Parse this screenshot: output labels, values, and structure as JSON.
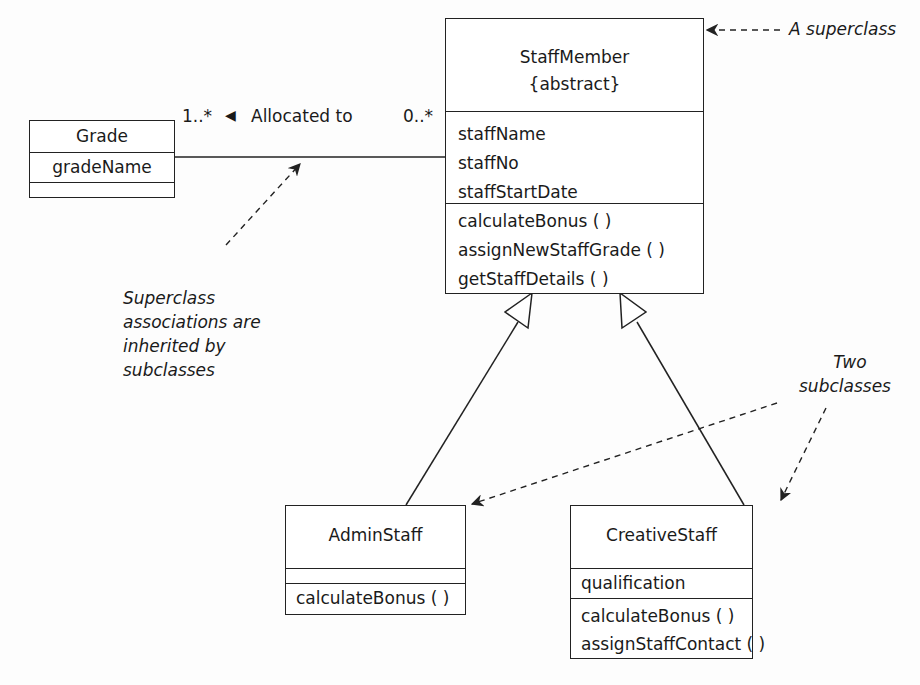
{
  "diagram": {
    "type": "UML class diagram",
    "classes": {
      "grade": {
        "name": "Grade",
        "attributes": [
          "gradeName"
        ],
        "operations": []
      },
      "staff_member": {
        "name": "StaffMember",
        "stereotype": "{abstract}",
        "attributes": [
          "staffName",
          "staffNo",
          "staffStartDate"
        ],
        "operations": [
          "calculateBonus ( )",
          "assignNewStaffGrade ( )",
          "getStaffDetails ( )"
        ]
      },
      "admin_staff": {
        "name": "AdminStaff",
        "attributes": [],
        "operations": [
          "calculateBonus ( )"
        ]
      },
      "creative_staff": {
        "name": "CreativeStaff",
        "attributes": [
          "qualification"
        ],
        "operations": [
          "calculateBonus ( )",
          "assignStaffContact ( )"
        ]
      }
    },
    "association": {
      "name": "Allocated to",
      "direction_marker": "◀",
      "grade_multiplicity": "1..*",
      "staff_multiplicity": "0..*"
    },
    "generalizations": [
      {
        "from": "AdminStaff",
        "to": "StaffMember"
      },
      {
        "from": "CreativeStaff",
        "to": "StaffMember"
      }
    ],
    "annotations": {
      "superclass": "A superclass",
      "inherited": [
        "Superclass",
        "associations are",
        "inherited by",
        "subclasses"
      ],
      "subclasses": [
        "Two",
        "subclasses"
      ]
    },
    "colors": {
      "line": "#222222",
      "text": "#1a1a1a",
      "background": "#fdfdfd"
    }
  }
}
